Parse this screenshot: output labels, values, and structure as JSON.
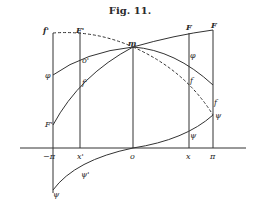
{
  "figure": {
    "title": "Fig. 11.",
    "axis_labels": {
      "neg_pi": "−π",
      "x_prime": "x'",
      "origin": "o",
      "x": "x",
      "pi": "π"
    },
    "point_labels": {
      "f_prime_left": "f'",
      "F_prime_top": "F'",
      "m": "m",
      "F_top1": "F",
      "F_top2": "F",
      "phi_left": "φ",
      "o_prime": "ο'",
      "phi_right": "φ",
      "f_lower_left": "f'",
      "f_mid_right": "f",
      "f_right": "f",
      "F_lower_left": "F'",
      "psi_right": "ψ",
      "psi_end": "ψ",
      "psi_prime": "ψ'",
      "psi_left_end": "ψ"
    }
  }
}
